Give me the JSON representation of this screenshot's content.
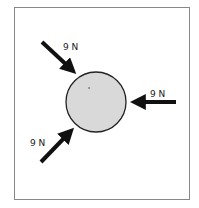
{
  "diagram": {
    "frame": {
      "x": 14,
      "y": 7,
      "width": 176,
      "height": 193,
      "stroke": "#888888"
    },
    "body": {
      "cx": 96,
      "cy": 102,
      "r": 30,
      "fill": "#d9d9d9",
      "stroke": "#222222"
    },
    "forces": [
      {
        "label": "9 N",
        "direction": "down-right",
        "label_x": 63,
        "label_y": 50
      },
      {
        "label": "9 N",
        "direction": "left",
        "label_x": 150,
        "label_y": 97
      },
      {
        "label": "9 N",
        "direction": "up-right",
        "label_x": 30,
        "label_y": 146
      }
    ]
  }
}
